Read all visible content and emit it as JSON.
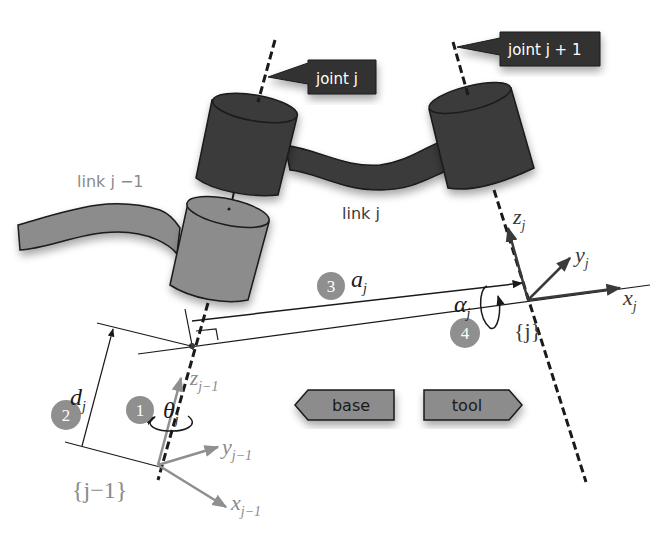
{
  "diagram": {
    "colors": {
      "dark_body": "#3a3a3a",
      "light_body": "#8c8c8c",
      "label_bg": "#333333",
      "label_text": "#ffffff",
      "gray_text": "#8a8a8a",
      "badge": "#8f8f8f",
      "line": "#1a1a1a",
      "arrow_box": "#8c8c8c"
    },
    "callouts": {
      "joint_j": "joint j",
      "joint_j_plus_1": "joint j + 1"
    },
    "links": {
      "link_j_minus_1": "link j −1",
      "link_j": "link j"
    },
    "frames": {
      "frame_j": {
        "label": "{j}",
        "axes": {
          "z": "z",
          "y": "y",
          "x": "x",
          "subscript": "j"
        }
      },
      "frame_j_minus_1": {
        "label": "{j−1}",
        "axes": {
          "z": "z",
          "y": "y",
          "x": "x",
          "subscript": "j−1"
        }
      }
    },
    "parameters": [
      {
        "step": "1",
        "symbol": "θ",
        "subscript": "j",
        "name": "joint angle"
      },
      {
        "step": "2",
        "symbol": "d",
        "subscript": "j",
        "name": "link offset"
      },
      {
        "step": "3",
        "symbol": "a",
        "subscript": "j",
        "name": "link length"
      },
      {
        "step": "4",
        "symbol": "α",
        "subscript": "j",
        "name": "link twist"
      }
    ],
    "direction_tags": {
      "base": "base",
      "tool": "tool"
    }
  }
}
